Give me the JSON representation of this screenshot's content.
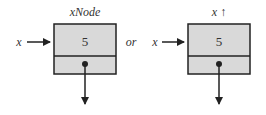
{
  "diagram": {
    "left": {
      "pointer_label": "x",
      "node_label": "xNode",
      "value": "5"
    },
    "connector": "or",
    "right": {
      "pointer_label": "x",
      "node_label": "x ↑",
      "value": "5"
    },
    "colors": {
      "box_fill": "#d9d9d9",
      "stroke": "#222222"
    }
  }
}
